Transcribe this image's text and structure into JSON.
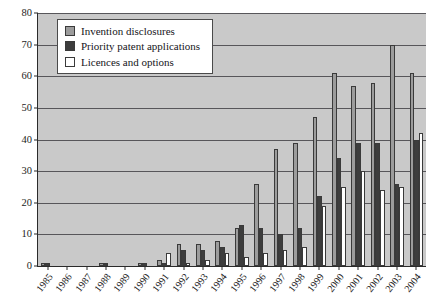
{
  "chart_data": {
    "type": "bar",
    "title": "",
    "subtitle": "",
    "xlabel": "",
    "ylabel": "",
    "ylim": [
      0,
      80
    ],
    "yticks": [
      0,
      10,
      20,
      30,
      40,
      50,
      60,
      70,
      80
    ],
    "grid": true,
    "legend_position": "top-left",
    "categories": [
      "1985",
      "1986",
      "1987",
      "1988",
      "1989",
      "1990",
      "1991",
      "1992",
      "1993",
      "1994",
      "1995",
      "1996",
      "1997",
      "1998",
      "1999",
      "2000",
      "2001",
      "2002",
      "2003",
      "2004"
    ],
    "series": [
      {
        "name": "Invention disclosures",
        "color": "#9c9c9c",
        "values": [
          1,
          0,
          0,
          1,
          0,
          1,
          2,
          7,
          7,
          8,
          12,
          26,
          37,
          39,
          47,
          61,
          57,
          58,
          70,
          61
        ]
      },
      {
        "name": "Priority patent applications",
        "color": "#3d3d3d",
        "values": [
          1,
          0,
          0,
          1,
          0,
          1,
          1,
          5,
          5,
          6,
          13,
          12,
          10,
          12,
          22,
          34,
          39,
          39,
          26,
          40
        ]
      },
      {
        "name": "Licences and options",
        "color": "#ffffff",
        "values": [
          0,
          0,
          0,
          0,
          0,
          0,
          4,
          1,
          2,
          4,
          3,
          4,
          5,
          6,
          19,
          25,
          30,
          24,
          25,
          42
        ]
      }
    ]
  },
  "legend": {
    "items": [
      {
        "label": "Invention disclosures",
        "swatch": "s0"
      },
      {
        "label": "Priority patent applications",
        "swatch": "s1"
      },
      {
        "label": "Licences and options",
        "swatch": "s2"
      }
    ]
  }
}
